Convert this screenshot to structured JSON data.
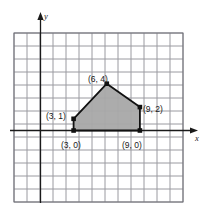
{
  "figure": {
    "type": "coordinate-grid-polygon",
    "axis_labels": {
      "x": "x",
      "y": "y"
    },
    "grid": {
      "visible": true,
      "columns": 13,
      "rows": 13,
      "color": "#9a9aa0",
      "border_color": "#6e6e76"
    },
    "axes": {
      "color": "#1a1a1a",
      "x_axis_arrow": "right",
      "y_axis_arrow": "up"
    },
    "shape": {
      "name": "pentagon",
      "fill": "#a8a8a8",
      "stroke": "#111111",
      "vertices": [
        {
          "label": "(3, 0)",
          "x": 3,
          "y": 0
        },
        {
          "label": "(3, 1)",
          "x": 3,
          "y": 1
        },
        {
          "label": "(6, 4)",
          "x": 6,
          "y": 4
        },
        {
          "label": "(9, 2)",
          "x": 9,
          "y": 2
        },
        {
          "label": "(9, 0)",
          "x": 9,
          "y": 0
        }
      ]
    },
    "point_labels": [
      {
        "text": "(6, 4)",
        "px": 88,
        "py": 82
      },
      {
        "text": "(9, 2)",
        "px": 143,
        "py": 112
      },
      {
        "text": "(3, 1)",
        "px": 46,
        "py": 119
      },
      {
        "text": "(3, 0)",
        "px": 61,
        "py": 148
      },
      {
        "text": "(9, 0)",
        "px": 122,
        "py": 148
      }
    ]
  }
}
